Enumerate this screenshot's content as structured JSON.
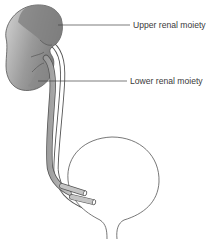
{
  "diagram": {
    "labels": {
      "upper": "Upper renal moiety",
      "lower": "Lower renal moiety"
    },
    "colors": {
      "kidney_dark": "#7e7e7e",
      "kidney_light": "#c9c9c9",
      "ureter_fill": "#bdbdbd",
      "outline": "#555555",
      "leader_line": "#444444",
      "background": "#ffffff"
    }
  }
}
